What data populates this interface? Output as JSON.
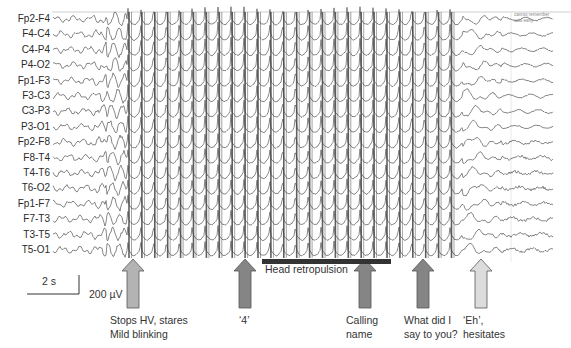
{
  "figure": {
    "type": "EEG absence seizure recording",
    "channels": [
      "Fp2-F4",
      "F4-C4",
      "C4-P4",
      "P4-O2",
      "Fp1-F3",
      "F3-C3",
      "C3-P3",
      "P3-O1",
      "Fp2-F8",
      "F8-T4",
      "T4-T6",
      "T6-O2",
      "Fp1-F7",
      "F7-T3",
      "T3-T5",
      "T5-O1"
    ],
    "seizure": {
      "start_x": 127,
      "end_x": 462,
      "period_px": 12.9
    },
    "top_note": "cannot remember\nsaid early",
    "scale": {
      "time": "2 s",
      "amplitude": "200 µV"
    },
    "bar": {
      "label": "Head retropulsion",
      "x1": 262,
      "x2": 391
    },
    "events": [
      {
        "x": 133,
        "label": "Stops HV, stares\nMild blinking",
        "fill": "#b3b3b3"
      },
      {
        "x": 245,
        "label": "‘4’",
        "fill": "#858585"
      },
      {
        "x": 365,
        "label": "Calling\nname",
        "fill": "#858585"
      },
      {
        "x": 423,
        "label": "What did I\nsay to you?",
        "fill": "#858585"
      },
      {
        "x": 481,
        "label": "‘Eh’,\nhesitates",
        "fill": "#dcdcdc"
      }
    ]
  },
  "colors": {
    "trace": "#555555",
    "spike": "#444444",
    "border": "#c8c8c8",
    "bar": "#333333",
    "arrow_stroke": "#555555"
  }
}
